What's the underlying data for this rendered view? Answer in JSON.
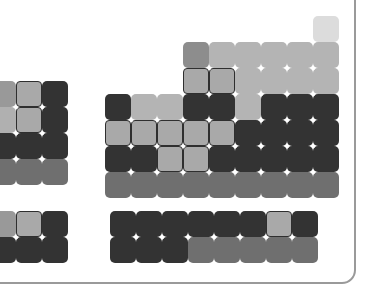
{
  "view": {
    "title": "Periodic Table Heatmap",
    "background": "#ffffff",
    "border_color": "#9a9a9a",
    "highlight_outline": "#2f2f2f",
    "grid_dot_color": "#ffffff"
  },
  "legend_colors": {
    "lightest": "#dcdcdc",
    "light": "#b9b9b9",
    "mid_light": "#a9a9a9",
    "mid": "#8d8d8d",
    "mid_dark": "#7a7a7a",
    "dark": "#6b6b6b",
    "darkest": "#333333"
  },
  "layout": {
    "cell_size": 26,
    "main_origin_x": 105,
    "main_origin_y": 16,
    "left_origin_x": -10,
    "left_origin_y": 81,
    "bottom_main_origin_x": 110,
    "bottom_main_origin_y": 211,
    "bottom_left_origin_x": -10,
    "bottom_left_origin_y": 211
  },
  "blocks": [
    {
      "name": "left-block",
      "origin_x": -10,
      "origin_y": 81,
      "cells": [
        {
          "col": 0,
          "row": 0,
          "color": "#999999",
          "highlight": false
        },
        {
          "col": 1,
          "row": 0,
          "color": "#a9a9a9",
          "highlight": true
        },
        {
          "col": 2,
          "row": 0,
          "color": "#333333",
          "highlight": false
        },
        {
          "col": 0,
          "row": 1,
          "color": "#b0b0b0",
          "highlight": false
        },
        {
          "col": 1,
          "row": 1,
          "color": "#a9a9a9",
          "highlight": true
        },
        {
          "col": 2,
          "row": 1,
          "color": "#333333",
          "highlight": false
        },
        {
          "col": 0,
          "row": 2,
          "color": "#333333",
          "highlight": false
        },
        {
          "col": 1,
          "row": 2,
          "color": "#333333",
          "highlight": false
        },
        {
          "col": 2,
          "row": 2,
          "color": "#333333",
          "highlight": false
        },
        {
          "col": 0,
          "row": 3,
          "color": "#6f6f6f",
          "highlight": false
        },
        {
          "col": 1,
          "row": 3,
          "color": "#6f6f6f",
          "highlight": false
        },
        {
          "col": 2,
          "row": 3,
          "color": "#6f6f6f",
          "highlight": false
        }
      ]
    },
    {
      "name": "main-block",
      "origin_x": 105,
      "origin_y": 16,
      "cells": [
        {
          "col": 8,
          "row": 0,
          "color": "#dcdcdc",
          "highlight": false
        },
        {
          "col": 3,
          "row": 1,
          "color": "#8d8d8d",
          "highlight": false
        },
        {
          "col": 4,
          "row": 1,
          "color": "#b4b4b4",
          "highlight": false
        },
        {
          "col": 5,
          "row": 1,
          "color": "#b4b4b4",
          "highlight": false
        },
        {
          "col": 6,
          "row": 1,
          "color": "#b4b4b4",
          "highlight": false
        },
        {
          "col": 7,
          "row": 1,
          "color": "#b4b4b4",
          "highlight": false
        },
        {
          "col": 8,
          "row": 1,
          "color": "#b4b4b4",
          "highlight": false
        },
        {
          "col": 3,
          "row": 2,
          "color": "#a9a9a9",
          "highlight": true
        },
        {
          "col": 4,
          "row": 2,
          "color": "#a9a9a9",
          "highlight": true
        },
        {
          "col": 5,
          "row": 2,
          "color": "#b4b4b4",
          "highlight": false
        },
        {
          "col": 6,
          "row": 2,
          "color": "#b4b4b4",
          "highlight": false
        },
        {
          "col": 7,
          "row": 2,
          "color": "#b4b4b4",
          "highlight": false
        },
        {
          "col": 8,
          "row": 2,
          "color": "#b4b4b4",
          "highlight": false
        },
        {
          "col": 0,
          "row": 3,
          "color": "#333333",
          "highlight": false
        },
        {
          "col": 1,
          "row": 3,
          "color": "#b4b4b4",
          "highlight": false
        },
        {
          "col": 2,
          "row": 3,
          "color": "#b4b4b4",
          "highlight": false
        },
        {
          "col": 3,
          "row": 3,
          "color": "#333333",
          "highlight": false
        },
        {
          "col": 4,
          "row": 3,
          "color": "#333333",
          "highlight": false
        },
        {
          "col": 5,
          "row": 3,
          "color": "#b4b4b4",
          "highlight": false
        },
        {
          "col": 6,
          "row": 3,
          "color": "#333333",
          "highlight": false
        },
        {
          "col": 7,
          "row": 3,
          "color": "#333333",
          "highlight": false
        },
        {
          "col": 8,
          "row": 3,
          "color": "#333333",
          "highlight": false
        },
        {
          "col": 0,
          "row": 4,
          "color": "#a9a9a9",
          "highlight": true
        },
        {
          "col": 1,
          "row": 4,
          "color": "#a9a9a9",
          "highlight": true
        },
        {
          "col": 2,
          "row": 4,
          "color": "#a9a9a9",
          "highlight": true
        },
        {
          "col": 3,
          "row": 4,
          "color": "#a9a9a9",
          "highlight": true
        },
        {
          "col": 4,
          "row": 4,
          "color": "#a9a9a9",
          "highlight": true
        },
        {
          "col": 5,
          "row": 4,
          "color": "#333333",
          "highlight": false
        },
        {
          "col": 6,
          "row": 4,
          "color": "#333333",
          "highlight": false
        },
        {
          "col": 7,
          "row": 4,
          "color": "#333333",
          "highlight": false
        },
        {
          "col": 8,
          "row": 4,
          "color": "#333333",
          "highlight": false
        },
        {
          "col": 0,
          "row": 5,
          "color": "#333333",
          "highlight": false
        },
        {
          "col": 1,
          "row": 5,
          "color": "#333333",
          "highlight": false
        },
        {
          "col": 2,
          "row": 5,
          "color": "#a9a9a9",
          "highlight": true
        },
        {
          "col": 3,
          "row": 5,
          "color": "#a9a9a9",
          "highlight": true
        },
        {
          "col": 4,
          "row": 5,
          "color": "#333333",
          "highlight": false
        },
        {
          "col": 5,
          "row": 5,
          "color": "#333333",
          "highlight": false
        },
        {
          "col": 6,
          "row": 5,
          "color": "#333333",
          "highlight": false
        },
        {
          "col": 7,
          "row": 5,
          "color": "#333333",
          "highlight": false
        },
        {
          "col": 8,
          "row": 5,
          "color": "#333333",
          "highlight": false
        },
        {
          "col": 0,
          "row": 6,
          "color": "#6f6f6f",
          "highlight": false
        },
        {
          "col": 1,
          "row": 6,
          "color": "#6f6f6f",
          "highlight": false
        },
        {
          "col": 2,
          "row": 6,
          "color": "#6f6f6f",
          "highlight": false
        },
        {
          "col": 3,
          "row": 6,
          "color": "#6f6f6f",
          "highlight": false
        },
        {
          "col": 4,
          "row": 6,
          "color": "#6f6f6f",
          "highlight": false
        },
        {
          "col": 5,
          "row": 6,
          "color": "#6f6f6f",
          "highlight": false
        },
        {
          "col": 6,
          "row": 6,
          "color": "#6f6f6f",
          "highlight": false
        },
        {
          "col": 7,
          "row": 6,
          "color": "#6f6f6f",
          "highlight": false
        },
        {
          "col": 8,
          "row": 6,
          "color": "#6f6f6f",
          "highlight": false
        }
      ]
    },
    {
      "name": "bottom-left-block",
      "origin_x": -10,
      "origin_y": 211,
      "cells": [
        {
          "col": 0,
          "row": 0,
          "color": "#999999",
          "highlight": false
        },
        {
          "col": 1,
          "row": 0,
          "color": "#a9a9a9",
          "highlight": true
        },
        {
          "col": 2,
          "row": 0,
          "color": "#333333",
          "highlight": false
        },
        {
          "col": 0,
          "row": 1,
          "color": "#333333",
          "highlight": false
        },
        {
          "col": 1,
          "row": 1,
          "color": "#333333",
          "highlight": false
        },
        {
          "col": 2,
          "row": 1,
          "color": "#333333",
          "highlight": false
        }
      ]
    },
    {
      "name": "bottom-main-block",
      "origin_x": 110,
      "origin_y": 211,
      "cells": [
        {
          "col": 0,
          "row": 0,
          "color": "#333333",
          "highlight": false
        },
        {
          "col": 1,
          "row": 0,
          "color": "#333333",
          "highlight": false
        },
        {
          "col": 2,
          "row": 0,
          "color": "#333333",
          "highlight": false
        },
        {
          "col": 3,
          "row": 0,
          "color": "#333333",
          "highlight": false
        },
        {
          "col": 4,
          "row": 0,
          "color": "#333333",
          "highlight": false
        },
        {
          "col": 5,
          "row": 0,
          "color": "#333333",
          "highlight": false
        },
        {
          "col": 6,
          "row": 0,
          "color": "#a9a9a9",
          "highlight": true
        },
        {
          "col": 7,
          "row": 0,
          "color": "#333333",
          "highlight": false
        },
        {
          "col": 0,
          "row": 1,
          "color": "#333333",
          "highlight": false
        },
        {
          "col": 1,
          "row": 1,
          "color": "#333333",
          "highlight": false
        },
        {
          "col": 2,
          "row": 1,
          "color": "#333333",
          "highlight": false
        },
        {
          "col": 3,
          "row": 1,
          "color": "#6f6f6f",
          "highlight": false
        },
        {
          "col": 4,
          "row": 1,
          "color": "#6f6f6f",
          "highlight": false
        },
        {
          "col": 5,
          "row": 1,
          "color": "#6f6f6f",
          "highlight": false
        },
        {
          "col": 6,
          "row": 1,
          "color": "#6f6f6f",
          "highlight": false
        },
        {
          "col": 7,
          "row": 1,
          "color": "#6f6f6f",
          "highlight": false
        }
      ]
    }
  ]
}
